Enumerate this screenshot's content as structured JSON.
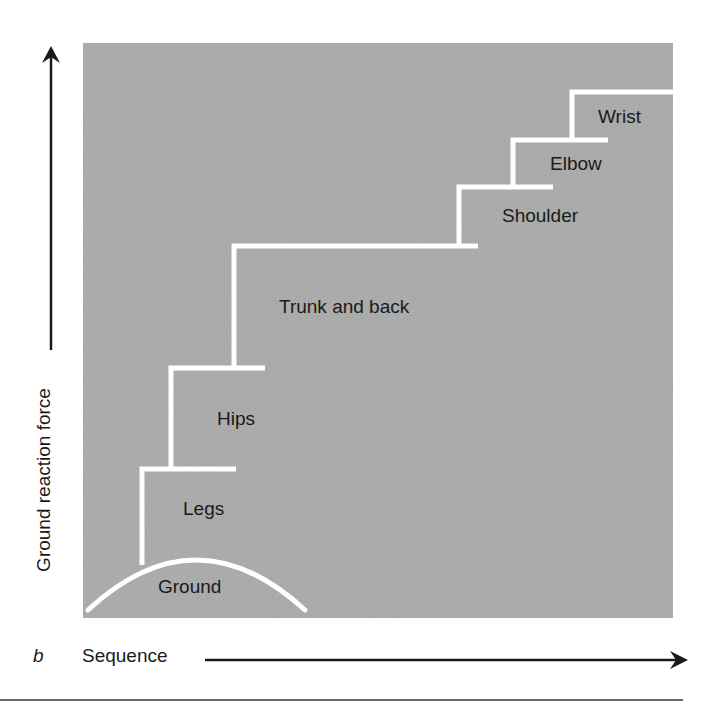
{
  "figure": {
    "panel_letter": "b",
    "y_axis_label": "Ground reaction force",
    "x_axis_label": "Sequence",
    "background_color": "#a9a9a9",
    "line_color": "#ffffff",
    "text_color": "#1a1a1a"
  },
  "segments": [
    {
      "label": "Ground",
      "order": 0
    },
    {
      "label": "Legs",
      "order": 1
    },
    {
      "label": "Hips",
      "order": 2
    },
    {
      "label": "Trunk and back",
      "order": 3
    },
    {
      "label": "Shoulder",
      "order": 4
    },
    {
      "label": "Elbow",
      "order": 5
    },
    {
      "label": "Wrist",
      "order": 6
    }
  ]
}
